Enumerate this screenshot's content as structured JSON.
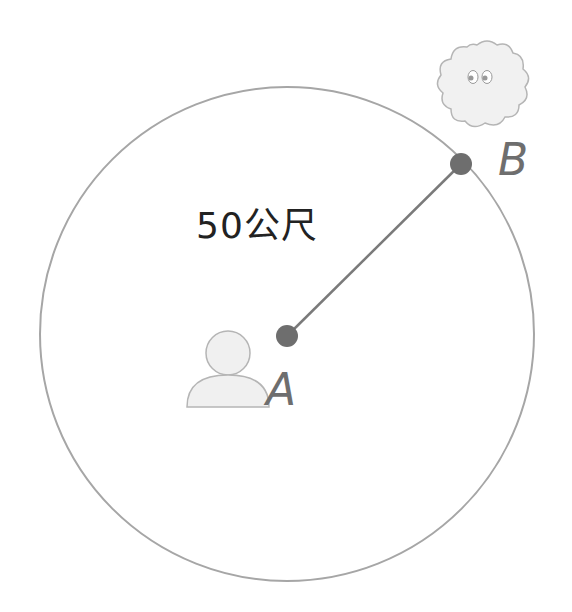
{
  "diagram": {
    "distance_label": "50公尺",
    "point_a_label": "A",
    "point_b_label": "B",
    "icons": {
      "person": "person-icon",
      "cloud": "cloud-creature-icon"
    },
    "colors": {
      "circle_stroke": "#a6a6a6",
      "line_stroke": "#7a7a7a",
      "point_fill": "#6e6e6e",
      "label_text": "#6e6e6e",
      "distance_text": "#222222",
      "icon_fill": "#efefef",
      "icon_stroke": "#b5b5b5"
    }
  }
}
